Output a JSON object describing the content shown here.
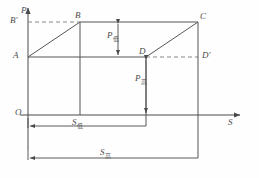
{
  "figure": {
    "type": "thermodynamic-cycle-diagram",
    "axes": {
      "y_label": "P",
      "x_label": "S",
      "origin_label": "O"
    },
    "points": [
      {
        "id": "A",
        "label": "A",
        "x": 28,
        "y": 57
      },
      {
        "id": "B",
        "label": "B",
        "x": 80,
        "y": 22
      },
      {
        "id": "C",
        "label": "C",
        "x": 198,
        "y": 22
      },
      {
        "id": "D",
        "label": "D",
        "x": 146,
        "y": 57
      },
      {
        "id": "Bp",
        "label": "B'",
        "x": 28,
        "y": 22
      },
      {
        "id": "Dp",
        "label": "D'",
        "x": 198,
        "y": 57
      }
    ],
    "pressure_labels": [
      {
        "id": "p-low",
        "text": "P",
        "sub": "低"
      },
      {
        "id": "p-high",
        "text": "P",
        "sub": "高"
      }
    ],
    "entropy_labels": [
      {
        "id": "s-low",
        "text": "S",
        "sub": "低"
      },
      {
        "id": "s-high",
        "text": "S",
        "sub": "高"
      }
    ],
    "colors": {
      "line": "#555555",
      "axis": "#4a4a4a",
      "dashed": "#777777",
      "text": "#4a4a4a",
      "background": "#fefefe"
    }
  }
}
